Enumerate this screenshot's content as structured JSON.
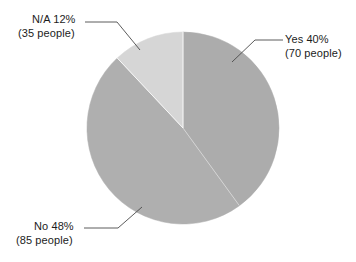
{
  "chart_data": {
    "type": "pie",
    "title": "",
    "categories": [
      "Yes",
      "No",
      "N/A"
    ],
    "values": [
      40,
      48,
      12
    ],
    "counts": [
      70,
      85,
      35
    ],
    "units": "percent",
    "total_people": 190,
    "start_angle_deg": 0,
    "direction": "clockwise",
    "legend": "none",
    "labels_position": "outside-with-leader-lines",
    "slices": [
      {
        "name": "Yes",
        "percent": 40,
        "count": 70,
        "color": "#ACACAC",
        "label_line1": "Yes 40%",
        "label_line2": "(70 people)"
      },
      {
        "name": "No",
        "percent": 48,
        "count": 85,
        "color": "#AFAFAF",
        "label_line1": "No 48%",
        "label_line2": "(85 people)"
      },
      {
        "name": "N/A",
        "percent": 12,
        "count": 35,
        "color": "#D6D6D6",
        "label_line1": "N/A 12%",
        "label_line2": "(35 people)"
      }
    ]
  },
  "colors": {
    "background": "#FFFFFF",
    "text": "#1C1C1C",
    "leader_line": "#4A4A4A",
    "slice_yes": "#ACACAC",
    "slice_no": "#AFAFAF",
    "slice_na": "#D6D6D6"
  },
  "labels": {
    "na": {
      "line1": "N/A 12%",
      "line2": "(35 people)"
    },
    "yes": {
      "line1": "Yes 40%",
      "line2": "(70 people)"
    },
    "no": {
      "line1": "No 48%",
      "line2": "(85 people)"
    }
  }
}
